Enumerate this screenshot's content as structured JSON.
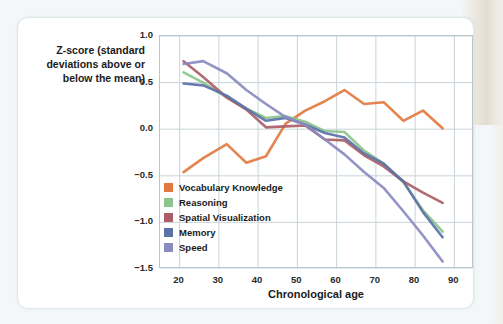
{
  "figure": {
    "y_axis_title": "Z-score (standard deviations above or below the mean)",
    "x_axis_title": "Chronological age"
  },
  "chart_data": {
    "type": "line",
    "title": "",
    "xlabel": "Chronological age",
    "ylabel": "Z-score (standard deviations above or below the mean)",
    "xlim": [
      15,
      95
    ],
    "ylim": [
      -1.5,
      1.0
    ],
    "xticks": [
      20,
      30,
      40,
      50,
      60,
      70,
      80,
      90
    ],
    "yticks": [
      1.0,
      0.5,
      0.0,
      -0.5,
      -1.0,
      -1.5
    ],
    "grid": true,
    "legend_position": "lower-left inside plot",
    "series": [
      {
        "name": "Vocabulary Knowledge",
        "color": "#e2793f",
        "x": [
          21,
          26,
          32,
          37,
          42,
          47,
          52,
          57,
          62,
          67,
          72,
          77,
          82,
          87
        ],
        "values": [
          -0.46,
          -0.31,
          -0.16,
          -0.36,
          -0.29,
          0.06,
          0.2,
          0.3,
          0.42,
          0.27,
          0.29,
          0.09,
          0.2,
          0.01
        ]
      },
      {
        "name": "Reasoning",
        "color": "#8cc48c",
        "x": [
          21,
          26,
          32,
          37,
          42,
          47,
          52,
          57,
          62,
          67,
          72,
          77,
          82,
          87
        ],
        "values": [
          0.61,
          0.5,
          0.34,
          0.22,
          0.12,
          0.14,
          0.08,
          -0.02,
          -0.03,
          -0.23,
          -0.37,
          -0.57,
          -0.87,
          -1.1
        ]
      },
      {
        "name": "Spatial Visualization",
        "color": "#ab5e68",
        "x": [
          21,
          26,
          32,
          37,
          42,
          47,
          52,
          57,
          62,
          67,
          72,
          77,
          82,
          87
        ],
        "values": [
          0.73,
          0.56,
          0.34,
          0.21,
          0.02,
          0.03,
          0.04,
          -0.11,
          -0.12,
          -0.28,
          -0.4,
          -0.56,
          -0.68,
          -0.79
        ]
      },
      {
        "name": "Memory",
        "color": "#5b72a8",
        "x": [
          21,
          26,
          32,
          37,
          42,
          47,
          52,
          57,
          62,
          67,
          72,
          77,
          82,
          87
        ],
        "values": [
          0.49,
          0.47,
          0.36,
          0.22,
          0.09,
          0.12,
          0.05,
          -0.04,
          -0.09,
          -0.26,
          -0.37,
          -0.56,
          -0.89,
          -1.16
        ]
      },
      {
        "name": "Speed",
        "color": "#8a8bc0",
        "x": [
          21,
          26,
          32,
          37,
          42,
          47,
          52,
          57,
          62,
          67,
          72,
          77,
          82,
          87
        ],
        "values": [
          0.7,
          0.73,
          0.6,
          0.42,
          0.27,
          0.13,
          0.05,
          -0.11,
          -0.27,
          -0.46,
          -0.63,
          -0.88,
          -1.14,
          -1.42
        ]
      }
    ]
  },
  "legend": {
    "items": [
      {
        "label": "Vocabulary Knowledge",
        "color": "#e2793f"
      },
      {
        "label": "Reasoning",
        "color": "#8cc48c"
      },
      {
        "label": "Spatial Visualization",
        "color": "#ab5e68"
      },
      {
        "label": "Memory",
        "color": "#5b72a8"
      },
      {
        "label": "Speed",
        "color": "#8a8bc0"
      }
    ]
  }
}
